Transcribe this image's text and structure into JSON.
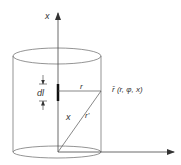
{
  "diagram": {
    "labels": {
      "axis_x": "x",
      "dl": "dl",
      "r": "r",
      "x": "x",
      "r_prime": "r'",
      "point": "r̄ (r, φ, x)"
    },
    "colors": {
      "line": "#555555",
      "text": "#333333",
      "element": "#111111"
    }
  }
}
